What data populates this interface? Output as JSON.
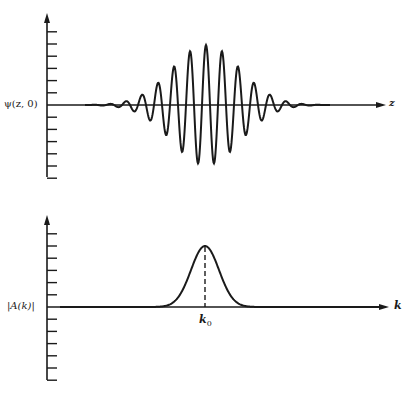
{
  "figure": {
    "top_panel": {
      "ylabel": "ψ(z, 0)",
      "xlabel": "z",
      "description": "Gaussian wave packet ψ(z,0): carrier oscillation under a Gaussian envelope"
    },
    "bottom_panel": {
      "ylabel": "|A(k)|",
      "xlabel": "k",
      "peak_label": "k",
      "peak_label_sub": "0",
      "description": "Gaussian amplitude spectrum |A(k)| centered at k0, with dashed line marking k0"
    },
    "colors": {
      "ink": "#1a1a1a",
      "background": "#ffffff"
    }
  },
  "chart_data": [
    {
      "type": "line",
      "title": "",
      "xlabel": "z",
      "ylabel": "ψ(z, 0)",
      "grid": false,
      "axis_ticks_above": 6,
      "axis_ticks_below": 6,
      "series": [
        {
          "name": "ψ(z,0)",
          "form": "A·exp(-(z-z0)²/(2σ²))·cos(2π(z-z0)/λ)",
          "center_px": 206,
          "amplitude_px": 60,
          "sigma_px": 34,
          "wavelength_px": 16,
          "x_start_px": 85,
          "x_end_px": 330
        }
      ]
    },
    {
      "type": "line",
      "title": "",
      "xlabel": "k",
      "ylabel": "|A(k)|",
      "grid": false,
      "axis_ticks_above": 6,
      "axis_ticks_below": 6,
      "annotations": [
        {
          "text": "k0",
          "x": "k0",
          "style": "dashed vertical line at peak"
        }
      ],
      "series": [
        {
          "name": "|A(k)|",
          "form": "A·exp(-(k-k0)²/(2σ²))",
          "center_px": 205,
          "amplitude_px": 61,
          "sigma_px": 14,
          "x_start_px": 60,
          "x_end_px": 380
        }
      ]
    }
  ]
}
